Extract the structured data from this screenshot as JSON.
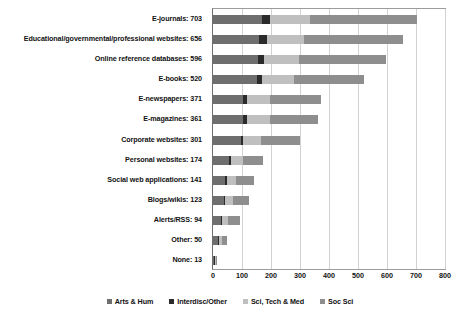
{
  "chart_data": {
    "type": "bar",
    "orientation": "horizontal",
    "stacked": true,
    "title": "",
    "subtitle": "",
    "xlabel": "",
    "ylabel": "",
    "xlim": [
      0,
      800
    ],
    "xticks": [
      0,
      100,
      200,
      300,
      400,
      500,
      600,
      700,
      800
    ],
    "grid": true,
    "legend_position": "bottom",
    "categories": [
      "E-journals: 703",
      "Educational/governmental/professional websites: 656",
      "Online reference databases: 596",
      "E-books: 520",
      "E-newspapers: 371",
      "E-magazines: 361",
      "Corporate websites: 301",
      "Personal websites: 174",
      "Social web applications: 141",
      "Blogs/wikis: 123",
      "Alerts/RSS: 94",
      "Other: 50",
      "None: 13"
    ],
    "totals": [
      703,
      656,
      596,
      520,
      371,
      361,
      301,
      174,
      141,
      123,
      94,
      50,
      13
    ],
    "series": [
      {
        "name": "Arts & Hum",
        "color": "#6e6e6e",
        "values": [
          170,
          160,
          155,
          150,
          105,
          105,
          95,
          55,
          42,
          37,
          28,
          17,
          5
        ]
      },
      {
        "name": "Interdisc/Other",
        "color": "#2b2b2b",
        "values": [
          27,
          25,
          22,
          20,
          13,
          13,
          10,
          7,
          6,
          5,
          4,
          2,
          1
        ]
      },
      {
        "name": "Sci, Tech & Med",
        "color": "#bfbfbf",
        "values": [
          136,
          130,
          120,
          110,
          80,
          78,
          62,
          40,
          30,
          26,
          20,
          11,
          3
        ]
      },
      {
        "name": "Soc Sci",
        "color": "#8e8e8e",
        "values": [
          370,
          341,
          299,
          240,
          173,
          165,
          134,
          72,
          63,
          55,
          42,
          20,
          4
        ]
      }
    ]
  },
  "legend": {
    "items": [
      {
        "label": "Arts & Hum",
        "color": "#6e6e6e"
      },
      {
        "label": "Interdisc/Other",
        "color": "#2b2b2b"
      },
      {
        "label": "Sci, Tech & Med",
        "color": "#bfbfbf"
      },
      {
        "label": "Soc Sci",
        "color": "#8e8e8e"
      }
    ]
  },
  "axis": {
    "tick_labels": [
      "0",
      "100",
      "200",
      "300",
      "400",
      "500",
      "600",
      "700",
      "800"
    ]
  }
}
